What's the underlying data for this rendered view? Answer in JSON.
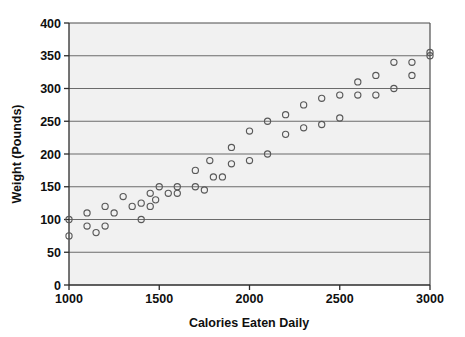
{
  "chart_data": {
    "type": "scatter",
    "title": "",
    "xlabel": "Calories Eaten Daily",
    "ylabel": "Weight (Pounds)",
    "xlim": [
      1000,
      3000
    ],
    "ylim": [
      0,
      400
    ],
    "xticks": [
      1000,
      1500,
      2000,
      2500,
      3000
    ],
    "yticks": [
      0,
      50,
      100,
      150,
      200,
      250,
      300,
      350,
      400
    ],
    "xtick_labels": [
      "1000",
      "1500",
      "2000",
      "2500",
      "3000"
    ],
    "ytick_labels": [
      "0",
      "50",
      "100",
      "150",
      "200",
      "250",
      "300",
      "350",
      "400"
    ],
    "grid": "horizontal",
    "legend": "none",
    "marker": "open-circle",
    "marker_color": "#595959",
    "plot_background": "#f1f1f1",
    "points": [
      {
        "x": 1000,
        "y": 100
      },
      {
        "x": 1000,
        "y": 75
      },
      {
        "x": 1100,
        "y": 110
      },
      {
        "x": 1100,
        "y": 90
      },
      {
        "x": 1150,
        "y": 80
      },
      {
        "x": 1200,
        "y": 120
      },
      {
        "x": 1200,
        "y": 90
      },
      {
        "x": 1250,
        "y": 110
      },
      {
        "x": 1300,
        "y": 135
      },
      {
        "x": 1350,
        "y": 120
      },
      {
        "x": 1400,
        "y": 125
      },
      {
        "x": 1400,
        "y": 100
      },
      {
        "x": 1450,
        "y": 140
      },
      {
        "x": 1450,
        "y": 120
      },
      {
        "x": 1480,
        "y": 130
      },
      {
        "x": 1500,
        "y": 150
      },
      {
        "x": 1550,
        "y": 140
      },
      {
        "x": 1600,
        "y": 150
      },
      {
        "x": 1600,
        "y": 140
      },
      {
        "x": 1700,
        "y": 175
      },
      {
        "x": 1700,
        "y": 150
      },
      {
        "x": 1750,
        "y": 145
      },
      {
        "x": 1780,
        "y": 190
      },
      {
        "x": 1800,
        "y": 165
      },
      {
        "x": 1850,
        "y": 165
      },
      {
        "x": 1900,
        "y": 210
      },
      {
        "x": 1900,
        "y": 185
      },
      {
        "x": 2000,
        "y": 235
      },
      {
        "x": 2000,
        "y": 190
      },
      {
        "x": 2100,
        "y": 250
      },
      {
        "x": 2100,
        "y": 200
      },
      {
        "x": 2200,
        "y": 260
      },
      {
        "x": 2200,
        "y": 230
      },
      {
        "x": 2300,
        "y": 275
      },
      {
        "x": 2300,
        "y": 240
      },
      {
        "x": 2400,
        "y": 285
      },
      {
        "x": 2400,
        "y": 245
      },
      {
        "x": 2500,
        "y": 290
      },
      {
        "x": 2500,
        "y": 255
      },
      {
        "x": 2600,
        "y": 310
      },
      {
        "x": 2600,
        "y": 290
      },
      {
        "x": 2700,
        "y": 320
      },
      {
        "x": 2700,
        "y": 290
      },
      {
        "x": 2800,
        "y": 340
      },
      {
        "x": 2800,
        "y": 300
      },
      {
        "x": 2900,
        "y": 340
      },
      {
        "x": 2900,
        "y": 320
      },
      {
        "x": 3000,
        "y": 355
      },
      {
        "x": 3000,
        "y": 350
      }
    ]
  }
}
